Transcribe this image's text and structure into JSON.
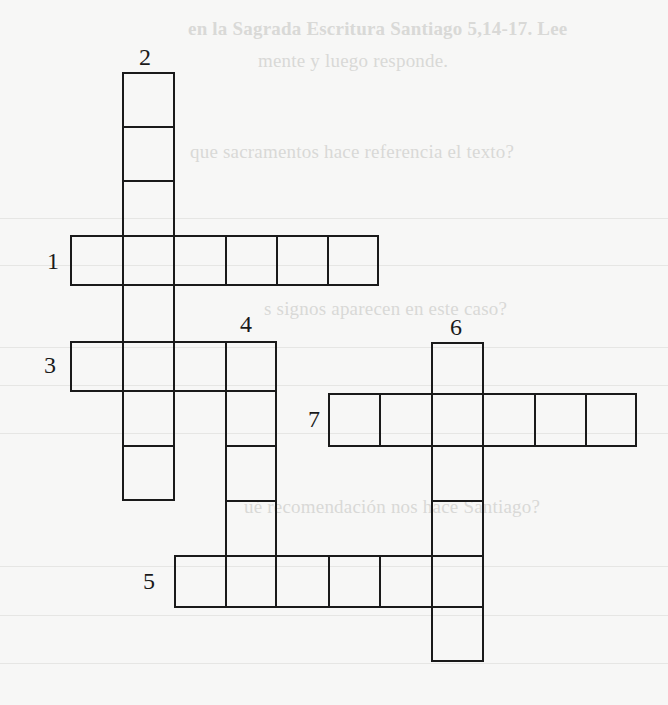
{
  "background_text": {
    "line_1": "en la Sagrada Escritura Santiago 5,14-17. Lee",
    "line_2": "mente y luego responde.",
    "line_3": "que sacramentos hace referencia el texto?",
    "line_4": "s signos aparecen en este caso?",
    "line_5": "ué recomendación nos hace Santiago?"
  },
  "crossword": {
    "clue_numbers": [
      "1",
      "2",
      "3",
      "4",
      "5",
      "6",
      "7"
    ],
    "words": [
      {
        "number": "1",
        "direction": "across",
        "length": 6
      },
      {
        "number": "2",
        "direction": "down",
        "length": 8
      },
      {
        "number": "3",
        "direction": "across",
        "length": 4
      },
      {
        "number": "4",
        "direction": "down",
        "length": 5
      },
      {
        "number": "5",
        "direction": "across",
        "length": 6
      },
      {
        "number": "6",
        "direction": "down",
        "length": 6
      },
      {
        "number": "7",
        "direction": "across",
        "length": 6
      }
    ],
    "line_color": "#1a1a1a",
    "paper_color": "#f7f7f6"
  }
}
